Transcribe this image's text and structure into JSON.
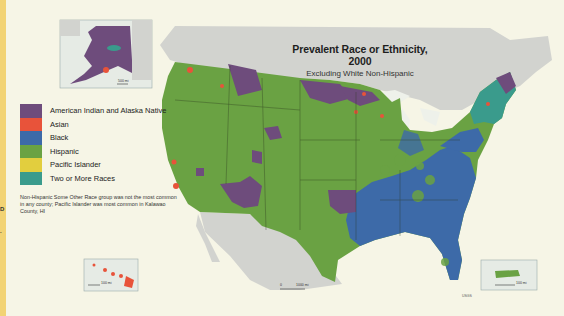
{
  "map": {
    "title": "Prevalent Race or Ethnicity, 2000",
    "subtitle": "Excluding White Non-Hispanic",
    "legend": [
      {
        "label": "American Indian and Alaska Native",
        "color": "#6e4c7c"
      },
      {
        "label": "Asian",
        "color": "#e8533a"
      },
      {
        "label": "Black",
        "color": "#3d6aa8"
      },
      {
        "label": "Hispanic",
        "color": "#6aa243"
      },
      {
        "label": "Pacific Islander",
        "color": "#e2ce3e"
      },
      {
        "label": "Two or More Races",
        "color": "#3a9b8c"
      }
    ],
    "note": "Non-Hispanic Some Other Race group was not the most common in any county; Pacific Islander was most common in Kalawao County, HI",
    "insets": {
      "alaska": {
        "scale_label": "500 mi"
      },
      "hawaii": {
        "scale_label": "100 mi"
      },
      "puerto_rico": {
        "scale_label": "100 mi"
      }
    },
    "main_scale": {
      "zero": "0",
      "label": "1000 mi"
    },
    "credit": "USGS",
    "page_edge_marks": [
      "D",
      "."
    ],
    "colors": {
      "background": "#f6f5e6",
      "land_other": "#d2d3cf",
      "water": "#eef1ea",
      "page_edge": "#f2d374"
    }
  }
}
